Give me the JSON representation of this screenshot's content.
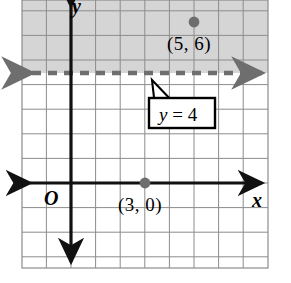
{
  "figure": {
    "kind": "coordinate-plane-graph",
    "background_color": "#ffffff"
  },
  "grid": {
    "line_color": "#8c8c8c",
    "shade_color": "#d5d5d5",
    "cell_size_px": 24.6,
    "left_px": 22,
    "right_px": 268,
    "top_px": 0,
    "bottom_px": 268,
    "columns": 10,
    "rows": 11
  },
  "axes": {
    "x_axis": {
      "label": "x",
      "color": "#000000",
      "y_pixel": 183
    },
    "y_axis": {
      "label": "y",
      "color": "#000000",
      "x_pixel": 71
    },
    "origin": {
      "label": "O"
    }
  },
  "boundary_line": {
    "equation_label": "y = 4",
    "equation_var": "y",
    "equation_rest": " = 4",
    "style": "dashed",
    "color": "#6e6e6e",
    "arrows": "both",
    "y_value": 4,
    "y_pixel": 73
  },
  "shaded_region": {
    "position": "above-line",
    "color": "#d5d5d5",
    "meaning": "y greater than 4"
  },
  "points": [
    {
      "label": "(5, 6)",
      "x": 5,
      "y": 6,
      "px": 194,
      "py": 22,
      "color": "#6e6e6e"
    },
    {
      "label": "(3, 0)",
      "x": 3,
      "y": 0,
      "px": 145,
      "py": 183,
      "color": "#6e6e6e"
    }
  ],
  "callout": {
    "text": "y = 4",
    "border_color": "#000000",
    "fill_color": "#ffffff"
  },
  "chart_data": {
    "type": "line",
    "title": "",
    "xlabel": "x",
    "ylabel": "y",
    "grid": true,
    "legend": "none",
    "xlim": [
      -2,
      8
    ],
    "ylim": [
      -4,
      7
    ],
    "series": [
      {
        "name": "y = 4",
        "kind": "horizontal-line",
        "value": 4,
        "style": "dashed",
        "color": "#6e6e6e"
      },
      {
        "name": "plotted points",
        "kind": "scatter",
        "x": [
          5,
          3
        ],
        "y": [
          6,
          0
        ],
        "labels": [
          "(5, 6)",
          "(3, 0)"
        ],
        "color": "#6e6e6e"
      }
    ],
    "annotations": [
      "y = 4",
      "(5, 6)",
      "(3, 0)",
      "O",
      "x",
      "y"
    ],
    "shaded_regions": [
      {
        "name": "y greater than 4",
        "from": 4,
        "to": 7,
        "color": "#d5d5d5"
      }
    ]
  }
}
